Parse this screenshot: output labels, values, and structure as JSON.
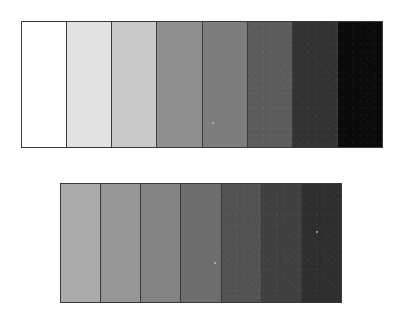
{
  "figure": {
    "background_color": "#ffffff",
    "border_color": "#3a3a3a"
  },
  "chart_data": {
    "type": "heatmap",
    "subtitle": "",
    "xlabel": "",
    "ylabel": "",
    "grid": false,
    "legend_position": "none",
    "strips": [
      {
        "name": "top-wedge",
        "patch_count": 8,
        "bounds_px": {
          "x": 21,
          "y": 21,
          "width": 362,
          "height": 127
        },
        "patch_width_px": 45,
        "categories": [
          "1",
          "2",
          "3",
          "4",
          "5",
          "6",
          "7",
          "8"
        ],
        "values": [
          255,
          226,
          201,
          143,
          125,
          92,
          50,
          10
        ],
        "colors": [
          "#ffffff",
          "#e2e2e2",
          "#c9c9c9",
          "#8f8f8f",
          "#7d7d7d",
          "#5c5c5c",
          "#323232",
          "#0a0a0a"
        ],
        "grain": [
          false,
          false,
          false,
          false,
          false,
          true,
          true,
          true
        ]
      },
      {
        "name": "bottom-wedge",
        "patch_count": 7,
        "bounds_px": {
          "x": 60,
          "y": 183,
          "width": 282,
          "height": 120
        },
        "patch_width_px": 40,
        "categories": [
          "1",
          "2",
          "3",
          "4",
          "5",
          "6",
          "7"
        ],
        "values": [
          171,
          150,
          131,
          110,
          82,
          64,
          46
        ],
        "colors": [
          "#ababab",
          "#969696",
          "#838383",
          "#6e6e6e",
          "#525252",
          "#404040",
          "#2e2e2e"
        ],
        "grain": [
          false,
          false,
          false,
          false,
          true,
          true,
          true
        ]
      }
    ],
    "specks": [
      {
        "name": "speck-top",
        "x": 212,
        "y": 122
      },
      {
        "name": "speck-mid",
        "x": 214,
        "y": 262
      },
      {
        "name": "speck-right",
        "x": 316,
        "y": 231
      }
    ]
  }
}
